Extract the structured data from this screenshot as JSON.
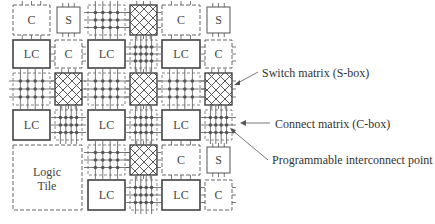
{
  "diagram": {
    "blocks": {
      "logic_cell": "LC",
      "connect_box": "C",
      "switch_box": "S",
      "logic_tile": [
        "Logic",
        "Tile"
      ]
    },
    "callouts": [
      {
        "id": "switch-matrix",
        "label": "Switch matrix (S-box)"
      },
      {
        "id": "connect-matrix",
        "label": "Connect matrix (C-box)"
      },
      {
        "id": "interconnect-point",
        "label": "Programmable interconnect point"
      }
    ],
    "colors": {
      "stroke": "#555555",
      "background": "#ffffff",
      "text": "#333333"
    }
  }
}
